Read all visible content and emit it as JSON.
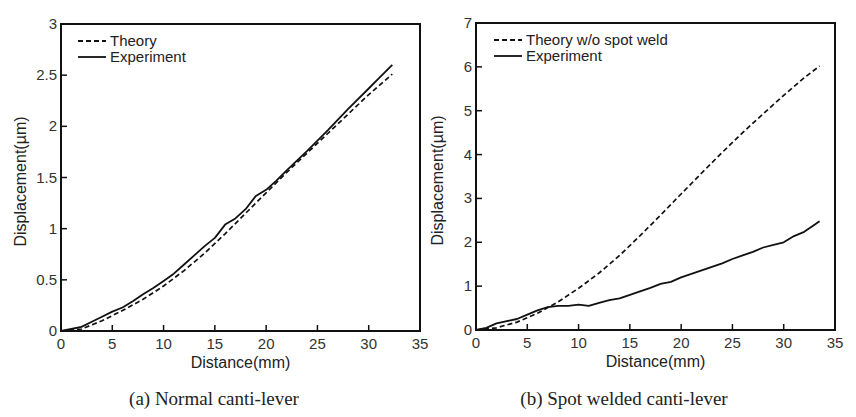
{
  "chart_data": [
    {
      "type": "line",
      "panel": "a",
      "caption": "(a) Normal canti-lever",
      "xlabel": "Distance(mm)",
      "ylabel": "Displacement(µm)",
      "xlim": [
        0,
        35
      ],
      "ylim": [
        0,
        3
      ],
      "xticks": [
        0,
        5,
        10,
        15,
        20,
        25,
        30,
        35
      ],
      "yticks": [
        0,
        0.5,
        1,
        1.5,
        2,
        2.5,
        3
      ],
      "ytick_labels": [
        "0",
        "0.5",
        "1",
        "1.5",
        "2",
        "2.5",
        "3"
      ],
      "grid": false,
      "legend_position": "upper left",
      "series": [
        {
          "name": "Theory",
          "style": "dashed",
          "x": [
            0,
            2,
            4,
            6,
            8,
            10,
            12,
            14,
            16,
            18,
            20,
            22,
            24,
            26,
            28,
            30,
            32.3
          ],
          "y": [
            0,
            0.02,
            0.1,
            0.2,
            0.31,
            0.44,
            0.59,
            0.76,
            0.95,
            1.15,
            1.35,
            1.55,
            1.74,
            1.93,
            2.12,
            2.31,
            2.51
          ]
        },
        {
          "name": "Experiment",
          "style": "solid",
          "x": [
            0,
            1,
            2,
            3,
            4,
            5,
            6,
            7,
            8,
            9,
            10,
            11,
            12,
            13,
            14,
            15,
            16,
            17,
            18,
            19,
            20,
            21,
            22,
            24,
            26,
            28,
            30,
            31,
            32.3
          ],
          "y": [
            0,
            0.02,
            0.04,
            0.09,
            0.14,
            0.19,
            0.23,
            0.29,
            0.36,
            0.42,
            0.49,
            0.56,
            0.65,
            0.74,
            0.83,
            0.91,
            1.04,
            1.1,
            1.19,
            1.32,
            1.38,
            1.47,
            1.57,
            1.76,
            1.96,
            2.17,
            2.37,
            2.47,
            2.6
          ]
        }
      ]
    },
    {
      "type": "line",
      "panel": "b",
      "caption": "(b) Spot welded canti-lever",
      "xlabel": "Distance(mm)",
      "ylabel": "Displacement(µm)",
      "xlim": [
        0,
        35
      ],
      "ylim": [
        0,
        7
      ],
      "xticks": [
        0,
        5,
        10,
        15,
        20,
        25,
        30,
        35
      ],
      "yticks": [
        0,
        1,
        2,
        3,
        4,
        5,
        6,
        7
      ],
      "ytick_labels": [
        "0",
        "1",
        "2",
        "3",
        "4",
        "5",
        "6",
        "7"
      ],
      "grid": false,
      "legend_position": "upper left",
      "series": [
        {
          "name": "Theory w/o spot weld",
          "style": "dashed",
          "x": [
            0,
            2,
            4,
            6,
            8,
            10,
            12,
            14,
            16,
            18,
            20,
            22,
            24,
            26,
            28,
            30,
            32,
            33.5
          ],
          "y": [
            0,
            0.05,
            0.18,
            0.38,
            0.64,
            0.95,
            1.3,
            1.7,
            2.15,
            2.62,
            3.1,
            3.58,
            4.05,
            4.5,
            4.93,
            5.35,
            5.75,
            6.02
          ]
        },
        {
          "name": "Experiment",
          "style": "solid",
          "x": [
            0,
            1,
            2,
            3,
            4,
            5,
            6,
            7,
            8,
            9,
            10,
            11,
            12,
            13,
            14,
            15,
            16,
            17,
            18,
            19,
            20,
            21,
            22,
            23,
            24,
            25,
            26,
            27,
            28,
            29,
            30,
            31,
            32,
            33,
            33.5
          ],
          "y": [
            0,
            0.05,
            0.15,
            0.2,
            0.25,
            0.35,
            0.45,
            0.52,
            0.55,
            0.55,
            0.58,
            0.55,
            0.62,
            0.68,
            0.72,
            0.8,
            0.88,
            0.96,
            1.05,
            1.1,
            1.2,
            1.28,
            1.36,
            1.44,
            1.52,
            1.62,
            1.7,
            1.78,
            1.88,
            1.94,
            2.0,
            2.14,
            2.24,
            2.4,
            2.48
          ]
        }
      ]
    }
  ]
}
